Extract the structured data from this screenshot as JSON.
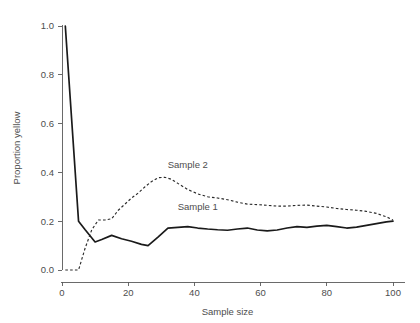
{
  "chart_data": {
    "type": "line",
    "title": "",
    "xlabel": "Sample size",
    "ylabel": "Proportion yellow",
    "xlim": [
      0,
      103
    ],
    "ylim": [
      0.0,
      1.02
    ],
    "grid": false,
    "legend_position": "inline-annotation",
    "xticks": [
      0,
      20,
      40,
      60,
      80,
      100
    ],
    "xtick_labels": [
      "0",
      "20",
      "40",
      "60",
      "80",
      "100"
    ],
    "yticks": [
      0.0,
      0.2,
      0.4,
      0.6,
      0.8,
      1.0
    ],
    "ytick_labels": [
      "0.0",
      "0.2",
      "0.4",
      "0.6",
      "0.8",
      "1.0"
    ],
    "annotations": [
      {
        "text": "Sample 2",
        "x": 38,
        "y": 0.42
      },
      {
        "text": "Sample 1",
        "x": 41,
        "y": 0.245
      }
    ],
    "series": [
      {
        "name": "Sample 1",
        "style": "solid",
        "color": "#1a1a1a",
        "x": [
          1,
          5,
          7,
          10,
          12,
          15,
          18,
          21,
          24,
          26,
          29,
          32,
          35,
          38,
          41,
          44,
          47,
          50,
          53,
          56,
          59,
          62,
          65,
          68,
          71,
          74,
          77,
          80,
          83,
          86,
          89,
          92,
          95,
          98,
          100
        ],
        "values": [
          1.0,
          0.2,
          0.165,
          0.115,
          0.125,
          0.142,
          0.128,
          0.118,
          0.105,
          0.1,
          0.135,
          0.172,
          0.175,
          0.178,
          0.172,
          0.168,
          0.165,
          0.163,
          0.168,
          0.172,
          0.164,
          0.16,
          0.164,
          0.172,
          0.178,
          0.175,
          0.18,
          0.183,
          0.178,
          0.172,
          0.176,
          0.183,
          0.19,
          0.197,
          0.2
        ]
      },
      {
        "name": "Sample 2",
        "style": "dashed",
        "color": "#2b2b2b",
        "x": [
          1,
          3,
          5,
          7,
          9,
          11,
          13,
          15,
          17,
          19,
          21,
          23,
          25,
          27,
          29,
          31,
          33,
          35,
          38,
          41,
          44,
          47,
          50,
          53,
          56,
          59,
          62,
          65,
          68,
          71,
          74,
          77,
          80,
          83,
          86,
          89,
          92,
          95,
          98,
          100
        ],
        "values": [
          0.0,
          0.0,
          0.0,
          0.09,
          0.165,
          0.205,
          0.205,
          0.21,
          0.245,
          0.27,
          0.295,
          0.315,
          0.34,
          0.362,
          0.378,
          0.38,
          0.372,
          0.355,
          0.33,
          0.312,
          0.3,
          0.295,
          0.288,
          0.278,
          0.27,
          0.268,
          0.265,
          0.262,
          0.262,
          0.265,
          0.266,
          0.262,
          0.258,
          0.252,
          0.248,
          0.245,
          0.24,
          0.232,
          0.218,
          0.205
        ]
      }
    ]
  },
  "axes": {
    "x_axis_name": "Sample size",
    "y_axis_name": "Proportion yellow"
  }
}
